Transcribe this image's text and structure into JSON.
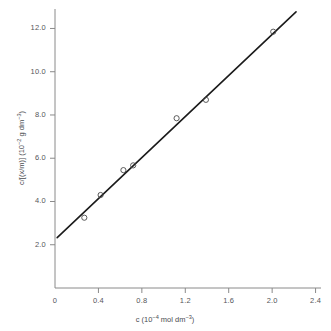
{
  "chart_data": {
    "type": "scatter",
    "title": "",
    "xlabel": "c (10⁻⁴ mol dm⁻³)",
    "ylabel": "c/[(x/m)] (10⁻² g dm⁻³)",
    "xlabel_parts": {
      "symbol": "c",
      "open": " (10",
      "exp1": "−4",
      "mid": " mol dm",
      "exp2": "−3",
      "close": ")"
    },
    "ylabel_parts": {
      "symbol": "c/[(x/m)]",
      "open": " (10",
      "exp1": "−2",
      "mid": " g dm",
      "exp2": "−3",
      "close": ")"
    },
    "xlim": [
      0,
      2.45
    ],
    "ylim": [
      0,
      12.9
    ],
    "xticks": [
      0,
      0.4,
      0.8,
      1.2,
      1.6,
      2.0,
      2.4
    ],
    "xticklabels": [
      "0",
      "0.4",
      "0.8",
      "1.2",
      "1.6",
      "2.0",
      "2.4"
    ],
    "yticks": [
      2.0,
      4.0,
      6.0,
      8.0,
      10.0,
      12.0
    ],
    "yticklabels": [
      "2.0",
      "4.0",
      "6.0",
      "8.0",
      "10.0",
      "12.0"
    ],
    "grid": false,
    "legend": false,
    "marker": "open-circle",
    "marker_color": "#4a4a4a",
    "line_color": "#1b1b1b",
    "axis_color": "#8a8a8a",
    "points": [
      {
        "x": 0.27,
        "y": 3.25
      },
      {
        "x": 0.42,
        "y": 4.3
      },
      {
        "x": 0.63,
        "y": 5.45
      },
      {
        "x": 0.72,
        "y": 5.67
      },
      {
        "x": 1.12,
        "y": 7.85
      },
      {
        "x": 1.39,
        "y": 8.7
      },
      {
        "x": 2.01,
        "y": 11.85
      }
    ],
    "fit_line": {
      "x_start": 0.02,
      "y_start": 2.33,
      "x_end": 2.22,
      "y_end": 12.77,
      "intercept": 2.3,
      "slope": 4.75
    }
  },
  "axes": {
    "x_axis_name": "x-axis",
    "y_axis_name": "y-axis"
  }
}
